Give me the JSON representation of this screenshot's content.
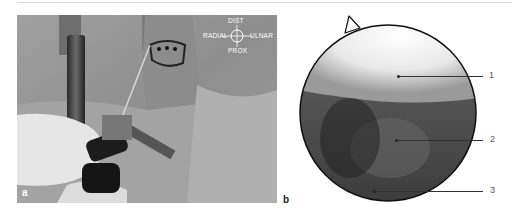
{
  "figure": {
    "panels": [
      {
        "label": "a",
        "description": "Arthroscopy setup on wrist with orientation marker",
        "orientation": {
          "top": "DIST",
          "left": "RADIAL",
          "right": "ULNAR",
          "bottom": "PROX"
        }
      },
      {
        "label": "b",
        "description": "Arthroscopic circular view",
        "callouts": [
          {
            "number": "1"
          },
          {
            "number": "2"
          },
          {
            "number": "3"
          }
        ]
      }
    ]
  }
}
